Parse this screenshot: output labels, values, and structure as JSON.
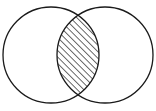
{
  "figure": {
    "type": "venn-diagram",
    "title": "",
    "set_count": 2,
    "background_color": "#ffffff",
    "stroke_color": "#1a1a1a",
    "stroke_width": 1.3,
    "canvas": {
      "width": 156,
      "height": 111
    }
  },
  "circles": [
    {
      "name": "left-set",
      "label": "",
      "cx": 51,
      "cy": 55,
      "r": 48,
      "fill": "none",
      "stroke": "#1a1a1a"
    },
    {
      "name": "right-set",
      "label": "",
      "cx": 105,
      "cy": 55,
      "r": 48,
      "fill": "none",
      "stroke": "#1a1a1a"
    }
  ],
  "intersection": {
    "name": "intersection-lens",
    "label": "",
    "shaded": true,
    "fill_pattern": "diagonal-hatch",
    "hatch_angle_deg": 45,
    "hatch_direction": "lower-left-to-upper-right",
    "hatch_spacing_px": 6.5,
    "hatch_color": "#1a1a1a",
    "hatch_line_width": 1.3,
    "crossing_points": [
      {
        "x": 78,
        "y": 8
      },
      {
        "x": 78,
        "y": 102
      }
    ],
    "lens_extent": {
      "left_x": 56,
      "right_x": 101,
      "top_y": 8,
      "bottom_y": 102
    }
  },
  "labels": {
    "left_region": "",
    "right_region": "",
    "intersection_region": "",
    "outside_region": ""
  }
}
